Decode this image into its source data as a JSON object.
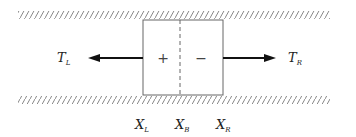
{
  "diagram": {
    "type": "channel-element-tension",
    "forces": {
      "left": {
        "symbol": "T",
        "subscript": "L"
      },
      "right": {
        "symbol": "T",
        "subscript": "R"
      }
    },
    "element": {
      "left_sign": "+",
      "right_sign": "−"
    },
    "positions": [
      {
        "symbol": "X",
        "subscript": "L"
      },
      {
        "symbol": "X",
        "subscript": "B"
      },
      {
        "symbol": "X",
        "subscript": "R"
      }
    ],
    "colors": {
      "line": "#555555",
      "arrow": "#111111",
      "hatch": "#777777"
    }
  }
}
